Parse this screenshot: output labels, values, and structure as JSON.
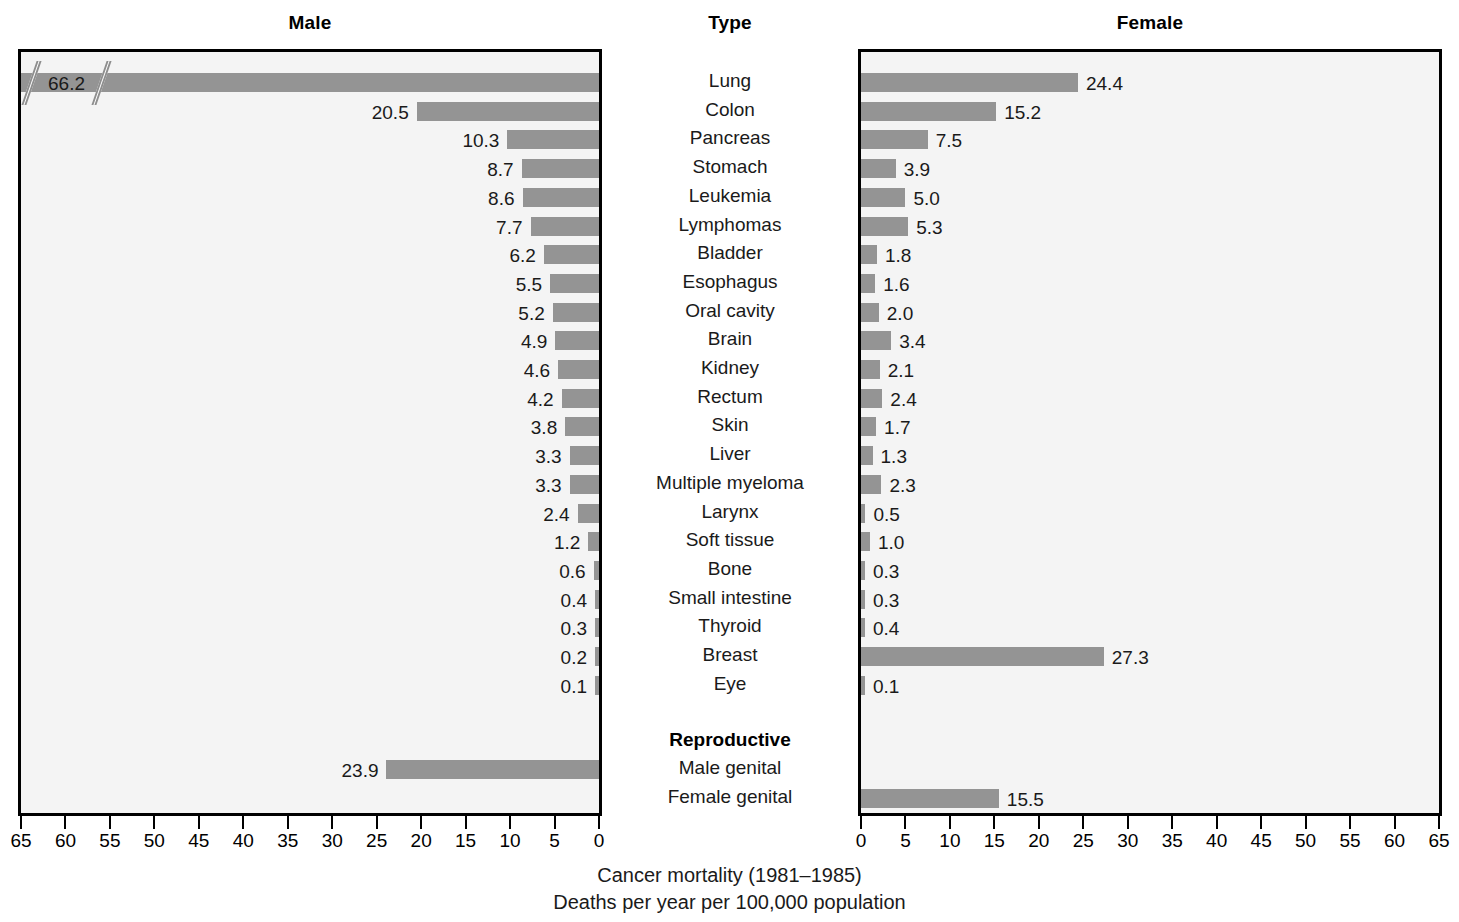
{
  "headers": {
    "male": "Male",
    "type": "Type",
    "female": "Female"
  },
  "caption": {
    "line1": "Cancer mortality (1981–1985)",
    "line2": "Deaths per year per 100,000 population"
  },
  "axis": {
    "male_ticks": [
      "65",
      "60",
      "55",
      "50",
      "45",
      "40",
      "35",
      "30",
      "25",
      "20",
      "15",
      "10",
      "5",
      "0"
    ],
    "female_ticks": [
      "0",
      "5",
      "10",
      "15",
      "20",
      "25",
      "30",
      "35",
      "40",
      "45",
      "50",
      "55",
      "60",
      "65"
    ],
    "min": 0,
    "max": 65,
    "step": 5
  },
  "groups": {
    "reproductive_label": "Reproductive"
  },
  "colors": {
    "bar": "#949494",
    "panel_background": "#f4f4f4",
    "panel_border": "#000000",
    "text": "#1a1a1a"
  },
  "chart_data": {
    "type": "bar",
    "title": "Cancer mortality (1981–1985)",
    "subtitle": "Deaths per year per 100,000 population",
    "orientation": "horizontal",
    "layout": "population-pyramid",
    "xlabel": "Deaths per year per 100,000 population",
    "ylabel": "Type",
    "xlim": [
      0,
      65
    ],
    "xticks": [
      0,
      5,
      10,
      15,
      20,
      25,
      30,
      35,
      40,
      45,
      50,
      55,
      60,
      65
    ],
    "grid": false,
    "legend": "none",
    "categories": [
      "Lung",
      "Colon",
      "Pancreas",
      "Stomach",
      "Leukemia",
      "Lymphomas",
      "Bladder",
      "Esophagus",
      "Oral cavity",
      "Brain",
      "Kidney",
      "Rectum",
      "Skin",
      "Liver",
      "Multiple myeloma",
      "Larynx",
      "Soft tissue",
      "Bone",
      "Small intestine",
      "Thyroid",
      "Breast",
      "Eye",
      "Male genital",
      "Female genital"
    ],
    "series": [
      {
        "name": "Male",
        "values": [
          66.2,
          20.5,
          10.3,
          8.7,
          8.6,
          7.7,
          6.2,
          5.5,
          5.2,
          4.9,
          4.6,
          4.2,
          3.8,
          3.3,
          3.3,
          2.4,
          1.2,
          0.6,
          0.4,
          0.3,
          0.2,
          0.1,
          23.9,
          null
        ],
        "labels": [
          "66.2",
          "20.5",
          "10.3",
          "8.7",
          "8.6",
          "7.7",
          "6.2",
          "5.5",
          "5.2",
          "4.9",
          "4.6",
          "4.2",
          "3.8",
          "3.3",
          "3.3",
          "2.4",
          "1.2",
          "0.6",
          "0.4",
          "0.3",
          "0.2",
          "0.1",
          "23.9",
          ""
        ]
      },
      {
        "name": "Female",
        "values": [
          24.4,
          15.2,
          7.5,
          3.9,
          5.0,
          5.3,
          1.8,
          1.6,
          2.0,
          3.4,
          2.1,
          2.4,
          1.7,
          1.3,
          2.3,
          0.5,
          1.0,
          0.3,
          0.3,
          0.4,
          27.3,
          0.1,
          null,
          15.5
        ],
        "labels": [
          "24.4",
          "15.2",
          "7.5",
          "3.9",
          "5.0",
          "5.3",
          "1.8",
          "1.6",
          "2.0",
          "3.4",
          "2.1",
          "2.4",
          "1.7",
          "1.3",
          "2.3",
          "0.5",
          "1.0",
          "0.3",
          "0.3",
          "0.4",
          "27.3",
          "0.1",
          "",
          "15.5"
        ]
      }
    ],
    "annotations": [
      {
        "category": "Lung",
        "series": "Male",
        "type": "axis-break",
        "note": "Bar value 66.2 exceeds plotted scale; drawn with a break symbol"
      }
    ],
    "group_headings": [
      {
        "label": "Reproductive",
        "before_category": "Male genital"
      }
    ]
  }
}
